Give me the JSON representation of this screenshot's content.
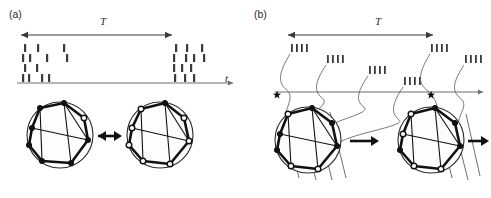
{
  "figure": {
    "width": 491,
    "height": 198,
    "background": "#ffffff",
    "ink_color": "#1a1a1a",
    "axis_color": "#6e6e6e",
    "tick_color": "#3a3a3a"
  },
  "panels": [
    {
      "id": "a",
      "label": "(a)",
      "label_pos": {
        "x": 9,
        "y": 8
      },
      "description": "irregular-spike-raster-with-two-network-states",
      "interval_label": "T",
      "interval_label_pos": {
        "x": 100,
        "y": 15
      },
      "interval_arrow": {
        "x1": 21,
        "x2": 172,
        "y": 35,
        "heads": "both"
      },
      "time_axis": {
        "x1": 17,
        "x2": 233,
        "y": 83,
        "arrow": "right"
      },
      "time_axis_label": "t",
      "time_axis_label_pos": {
        "x": 225,
        "y": 72
      },
      "raster": {
        "rows": 4,
        "row_y": [
          44,
          54,
          64,
          74
        ],
        "tick_w": 2.2,
        "tick_h": 8,
        "spike_times": [
          [
            24,
            37,
            63,
            175,
            186,
            201
          ],
          [
            22,
            29,
            46,
            66,
            173,
            185,
            193,
            203
          ],
          [
            24,
            36,
            173,
            181,
            190
          ],
          [
            22,
            28,
            41,
            48,
            174,
            184,
            193
          ]
        ]
      },
      "networks": [
        {
          "name": "network-state-left",
          "center": {
            "x": 60,
            "y": 135
          },
          "radius": 33,
          "nodes": [
            {
              "x": 32,
              "y": 128,
              "style": "filled"
            },
            {
              "x": 40,
              "y": 108,
              "style": "filled"
            },
            {
              "x": 64,
              "y": 103,
              "style": "filled"
            },
            {
              "x": 84,
              "y": 118,
              "style": "open"
            },
            {
              "x": 88,
              "y": 140,
              "style": "filled"
            },
            {
              "x": 71,
              "y": 163,
              "style": "filled"
            },
            {
              "x": 42,
              "y": 161,
              "style": "filled"
            },
            {
              "x": 29,
              "y": 145,
              "style": "filled"
            }
          ],
          "edges": [
            [
              0,
              1
            ],
            [
              1,
              2
            ],
            [
              2,
              3
            ],
            [
              3,
              4
            ],
            [
              4,
              5
            ],
            [
              5,
              6
            ],
            [
              6,
              7
            ],
            [
              7,
              0
            ],
            [
              2,
              5
            ],
            [
              0,
              4
            ],
            [
              1,
              6
            ],
            [
              2,
              4
            ]
          ]
        },
        {
          "name": "network-state-right",
          "center": {
            "x": 160,
            "y": 135
          },
          "radius": 33,
          "nodes": [
            {
              "x": 132,
              "y": 128,
              "style": "open"
            },
            {
              "x": 141,
              "y": 109,
              "style": "open"
            },
            {
              "x": 165,
              "y": 103,
              "style": "filled"
            },
            {
              "x": 184,
              "y": 118,
              "style": "open"
            },
            {
              "x": 189,
              "y": 141,
              "style": "open"
            },
            {
              "x": 170,
              "y": 164,
              "style": "open"
            },
            {
              "x": 143,
              "y": 161,
              "style": "open"
            },
            {
              "x": 129,
              "y": 145,
              "style": "open"
            }
          ],
          "edges": [
            [
              0,
              1
            ],
            [
              1,
              2
            ],
            [
              2,
              3
            ],
            [
              3,
              4
            ],
            [
              4,
              5
            ],
            [
              5,
              6
            ],
            [
              6,
              7
            ],
            [
              7,
              0
            ],
            [
              2,
              5
            ],
            [
              0,
              4
            ],
            [
              1,
              6
            ],
            [
              2,
              4
            ]
          ]
        }
      ],
      "transition_arrow": {
        "x1": 98,
        "x2": 122,
        "y": 136,
        "heads": "both"
      }
    },
    {
      "id": "b",
      "label": "(b)",
      "label_pos": {
        "x": 254,
        "y": 8
      },
      "description": "regular-burst-staircase-raster-with-network-evolution",
      "interval_label": "T",
      "interval_label_pos": {
        "x": 375,
        "y": 15
      },
      "interval_arrow": {
        "x1": 288,
        "x2": 433,
        "y": 35,
        "heads": "both"
      },
      "time_axis": {
        "x1": 275,
        "x2": 483,
        "y": 92,
        "arrow": "right"
      },
      "bursts": [
        {
          "x": 291,
          "y": 44,
          "n": 4,
          "spacing": 5.0
        },
        {
          "x": 327,
          "y": 55,
          "n": 4,
          "spacing": 5.0
        },
        {
          "x": 369,
          "y": 66,
          "n": 4,
          "spacing": 5.0
        },
        {
          "x": 404,
          "y": 77,
          "n": 4,
          "spacing": 5.0
        },
        {
          "x": 431,
          "y": 44,
          "n": 4,
          "spacing": 5.0
        },
        {
          "x": 465,
          "y": 55,
          "n": 4,
          "spacing": 5.0
        }
      ],
      "burst_tick_w": 1.8,
      "burst_tick_h": 8,
      "stars": [
        {
          "x": 277,
          "y": 95,
          "name": "star-marker-left"
        },
        {
          "x": 431,
          "y": 95,
          "name": "star-marker-right"
        }
      ],
      "connectors": [
        {
          "from": {
            "x": 290,
            "y": 54
          },
          "to": {
            "x": 285,
            "y": 122
          }
        },
        {
          "from": {
            "x": 326,
            "y": 65
          },
          "to": {
            "x": 307,
            "y": 128
          }
        },
        {
          "from": {
            "x": 368,
            "y": 76
          },
          "to": {
            "x": 322,
            "y": 136
          }
        },
        {
          "from": {
            "x": 403,
            "y": 87
          },
          "to": {
            "x": 336,
            "y": 150
          }
        },
        {
          "from": {
            "x": 430,
            "y": 54
          },
          "to": {
            "x": 438,
            "y": 122
          }
        },
        {
          "from": {
            "x": 464,
            "y": 65
          },
          "to": {
            "x": 458,
            "y": 128
          }
        }
      ],
      "networks": [
        {
          "name": "network-state-b-left",
          "center": {
            "x": 308,
            "y": 140
          },
          "radius": 33,
          "nodes": [
            {
              "x": 280,
              "y": 134,
              "style": "filled"
            },
            {
              "x": 288,
              "y": 114,
              "style": "open"
            },
            {
              "x": 312,
              "y": 108,
              "style": "filled"
            },
            {
              "x": 332,
              "y": 123,
              "style": "filled"
            },
            {
              "x": 337,
              "y": 146,
              "style": "filled"
            },
            {
              "x": 318,
              "y": 169,
              "style": "open"
            },
            {
              "x": 291,
              "y": 166,
              "style": "open"
            },
            {
              "x": 277,
              "y": 150,
              "style": "filled"
            }
          ],
          "edges": [
            [
              0,
              1
            ],
            [
              1,
              2
            ],
            [
              2,
              3
            ],
            [
              3,
              4
            ],
            [
              4,
              5
            ],
            [
              5,
              6
            ],
            [
              6,
              7
            ],
            [
              7,
              0
            ],
            [
              2,
              5
            ],
            [
              0,
              4
            ],
            [
              1,
              6
            ],
            [
              2,
              4
            ]
          ]
        },
        {
          "name": "network-state-b-right",
          "center": {
            "x": 431,
            "y": 140
          },
          "radius": 33,
          "nodes": [
            {
              "x": 403,
              "y": 134,
              "style": "open"
            },
            {
              "x": 411,
              "y": 114,
              "style": "open"
            },
            {
              "x": 435,
              "y": 108,
              "style": "filled"
            },
            {
              "x": 455,
              "y": 123,
              "style": "filled"
            },
            {
              "x": 460,
              "y": 146,
              "style": "filled"
            },
            {
              "x": 441,
              "y": 169,
              "style": "open"
            },
            {
              "x": 414,
              "y": 166,
              "style": "open"
            },
            {
              "x": 400,
              "y": 150,
              "style": "filled"
            }
          ],
          "edges": [
            [
              0,
              1
            ],
            [
              1,
              2
            ],
            [
              2,
              3
            ],
            [
              3,
              4
            ],
            [
              4,
              5
            ],
            [
              5,
              6
            ],
            [
              6,
              7
            ],
            [
              7,
              0
            ],
            [
              2,
              5
            ],
            [
              0,
              4
            ],
            [
              1,
              6
            ],
            [
              2,
              4
            ]
          ]
        }
      ],
      "transition_arrows": [
        {
          "x1": 350,
          "x2": 379,
          "y": 141,
          "heads": "right"
        },
        {
          "x1": 468,
          "x2": 489,
          "y": 141,
          "heads": "right"
        }
      ]
    }
  ]
}
